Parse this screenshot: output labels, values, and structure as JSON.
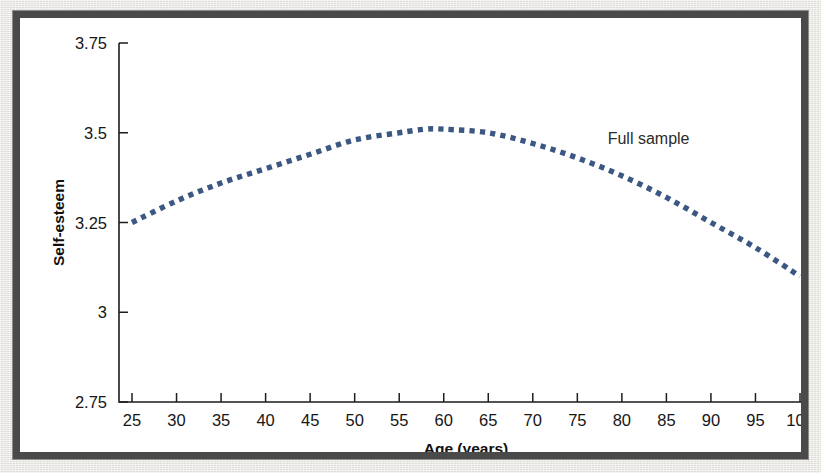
{
  "figure": {
    "background_color": "#ffffff",
    "frame_color": "#4a4a4a",
    "page_color": "#e8e6e1"
  },
  "chart_data": {
    "type": "line",
    "title": "",
    "xlabel": "Age (years)",
    "ylabel": "Self-esteem",
    "xlim": [
      25,
      100
    ],
    "ylim": [
      2.75,
      3.75
    ],
    "grid": false,
    "legend_position": "inline-annotation",
    "xticks": [
      25,
      30,
      35,
      40,
      45,
      50,
      55,
      60,
      65,
      70,
      75,
      80,
      85,
      90,
      95,
      100
    ],
    "xticklabels": [
      "25",
      "30",
      "35",
      "40",
      "45",
      "50",
      "55",
      "60",
      "65",
      "70",
      "75",
      "80",
      "85",
      "90",
      "95",
      "100"
    ],
    "yticks": [
      2.75,
      3,
      3.25,
      3.5,
      3.75
    ],
    "yticklabels": [
      "2.75",
      "3",
      "3.25",
      "3.5",
      "3.75"
    ],
    "annotations": [
      {
        "text": "Full sample",
        "x": 83,
        "y": 3.47
      }
    ],
    "series": [
      {
        "name": "Full sample",
        "style": "dotted",
        "color": "#3b5782",
        "x": [
          25,
          30,
          35,
          40,
          45,
          50,
          55,
          58,
          60,
          65,
          70,
          75,
          80,
          85,
          90,
          95,
          100
        ],
        "values": [
          3.25,
          3.31,
          3.36,
          3.4,
          3.44,
          3.48,
          3.5,
          3.51,
          3.51,
          3.5,
          3.47,
          3.43,
          3.38,
          3.32,
          3.25,
          3.18,
          3.1
        ]
      }
    ]
  }
}
